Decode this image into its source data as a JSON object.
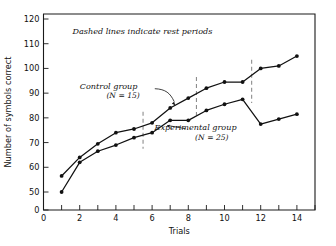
{
  "chart_data": {
    "type": "line",
    "title": "",
    "xlabel": "Trials",
    "ylabel": "Number of symbols correct",
    "xlim": [
      0,
      15
    ],
    "ylim": [
      45,
      120
    ],
    "grid": false,
    "legend_position": "inline-annotations",
    "y_axis_break_at": 45,
    "x_ticks": [
      0,
      1,
      2,
      3,
      4,
      5,
      6,
      7,
      8,
      9,
      10,
      11,
      12,
      13,
      14,
      15
    ],
    "x_tick_labels": [
      "0",
      "",
      "2",
      "",
      "4",
      "",
      "6",
      "",
      "8",
      "",
      "10",
      "",
      "12",
      "",
      "14",
      ""
    ],
    "y_ticks": [
      0,
      50,
      60,
      70,
      80,
      90,
      100,
      110,
      120
    ],
    "y_tick_labels": [
      "0",
      "50",
      "60",
      "70",
      "80",
      "90",
      "100",
      "110",
      "120"
    ],
    "x": [
      1,
      2,
      3,
      4,
      5,
      6,
      7,
      8,
      9,
      10,
      11,
      12,
      13,
      14
    ],
    "series": [
      {
        "name": "Control group",
        "n": 15,
        "label": "Control group",
        "n_label": "(N = 15)",
        "color": "#111111",
        "values": [
          56.5,
          64,
          69.5,
          74,
          75.5,
          78,
          84,
          88,
          92,
          94.5,
          94.5,
          100,
          101,
          105
        ]
      },
      {
        "name": "Experimental group",
        "n": 25,
        "label": "Experimental group",
        "n_label": "(N = 25)",
        "color": "#111111",
        "values": [
          50,
          62,
          66.5,
          69,
          72,
          74,
          79,
          79,
          83,
          85.5,
          87.5,
          77.5,
          79.5,
          81.5
        ]
      }
    ],
    "rest_periods": [
      {
        "x": 5.5,
        "label": "rest period 1"
      },
      {
        "x": 8.45,
        "label": "rest period 2"
      },
      {
        "x": 11.5,
        "label": "rest period 3"
      }
    ],
    "annotations": [
      {
        "id": "note",
        "text": "Dashed lines indicate rest periods",
        "x": 1.6,
        "y": 114
      },
      {
        "id": "control-label",
        "text": "Control group",
        "x": 3.6,
        "y": 91.5
      },
      {
        "id": "control-n",
        "text": "(N = 15)",
        "x": 4.4,
        "y": 88.0
      },
      {
        "id": "experimental-label",
        "text": "Experimental group",
        "x": 8.4,
        "y": 75.0
      },
      {
        "id": "experimental-n",
        "text": "(N = 25)",
        "x": 9.3,
        "y": 71.2
      }
    ]
  }
}
